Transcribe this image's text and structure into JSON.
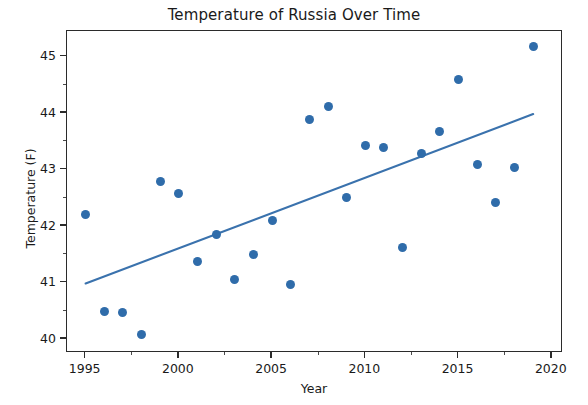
{
  "chart_data": {
    "type": "scatter",
    "title": "Temperature of Russia Over Time",
    "xlabel": "Year",
    "ylabel": "Temperature (F)",
    "xlim": [
      1994.0,
      2020.6
    ],
    "ylim": [
      39.75,
      45.45
    ],
    "xticks": [
      1995,
      2000,
      2005,
      2010,
      2015,
      2020
    ],
    "yticks": [
      40,
      41,
      42,
      43,
      44,
      45
    ],
    "xtick_labels": [
      "1995",
      "2000",
      "2005",
      "2010",
      "2015",
      "2020"
    ],
    "ytick_labels": [
      "40",
      "41",
      "42",
      "43",
      "44",
      "45"
    ],
    "grid": false,
    "legend": null,
    "marker_color": "#2f6caa",
    "line_color": "#3a72ad",
    "x": [
      1995,
      1996,
      1997,
      1998,
      1999,
      2000,
      2001,
      2002,
      2003,
      2004,
      2005,
      2006,
      2007,
      2008,
      2009,
      2010,
      2011,
      2012,
      2013,
      2014,
      2015,
      2016,
      2017,
      2018,
      2019
    ],
    "values": [
      42.21,
      40.48,
      40.46,
      40.07,
      42.78,
      42.57,
      41.37,
      41.84,
      41.05,
      41.49,
      42.1,
      40.97,
      43.88,
      44.12,
      42.5,
      43.43,
      43.38,
      41.61,
      43.28,
      43.67,
      44.6,
      43.08,
      42.42,
      43.04,
      45.17
    ],
    "trendline": {
      "type": "linear-fit",
      "x_start": 1995,
      "y_start": 40.98,
      "x_end": 2019,
      "y_end": 43.98
    }
  }
}
